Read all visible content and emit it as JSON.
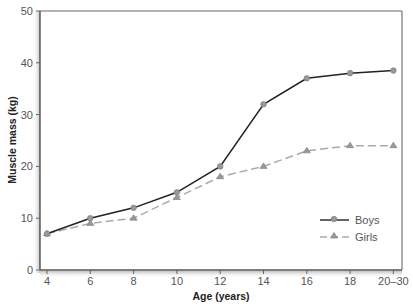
{
  "chart_data": {
    "type": "line",
    "title": "",
    "xlabel": "Age (years)",
    "ylabel": "Muscle mass (kg)",
    "categories": [
      "4",
      "6",
      "8",
      "10",
      "12",
      "14",
      "16",
      "18",
      "20–30"
    ],
    "ylim": [
      0,
      50
    ],
    "yticks": [
      0,
      10,
      20,
      30,
      40,
      50
    ],
    "grid": false,
    "legend_position": "lower right",
    "series": [
      {
        "name": "Boys",
        "style": "solid",
        "marker": "circle",
        "color": "#222222",
        "marker_color": "#999999",
        "values": [
          7,
          10,
          12,
          15,
          20,
          32,
          37,
          38,
          38.5
        ]
      },
      {
        "name": "Girls",
        "style": "dashed",
        "marker": "triangle",
        "color": "#aaaaaa",
        "marker_color": "#999999",
        "values": [
          7,
          9,
          10,
          14,
          18,
          20,
          23,
          24,
          24
        ]
      }
    ]
  },
  "legend": {
    "boys_label": "Boys",
    "girls_label": "Girls"
  },
  "axes": {
    "x_title": "Age (years)",
    "y_title": "Muscle mass (kg)"
  }
}
